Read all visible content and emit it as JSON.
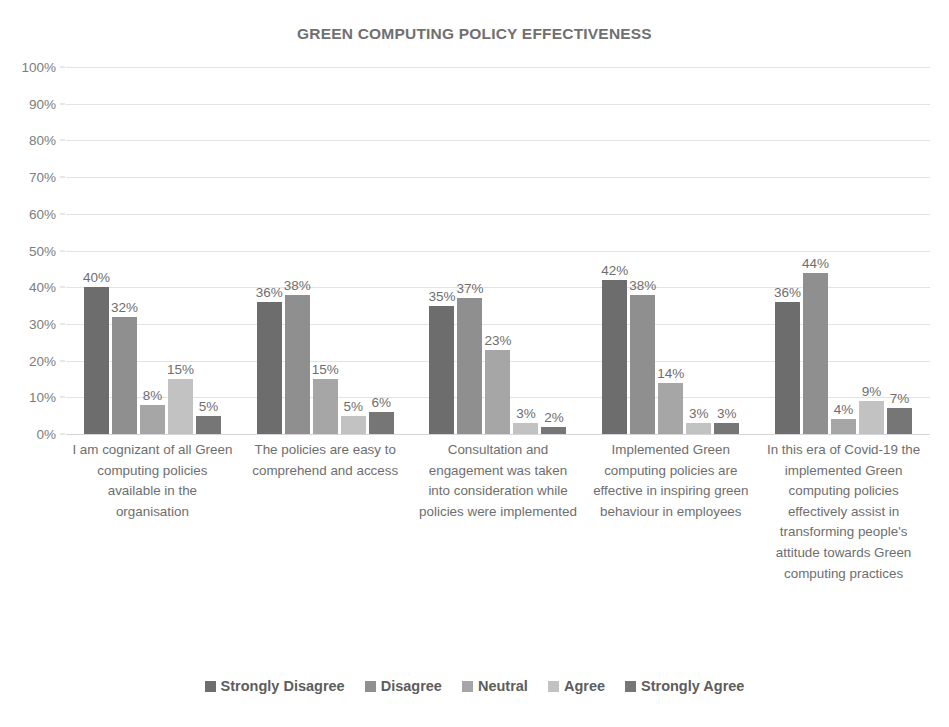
{
  "chart_data": {
    "type": "bar",
    "title": "GREEN COMPUTING POLICY EFFECTIVENESS",
    "xlabel": "",
    "ylabel": "",
    "ylim": [
      0,
      100
    ],
    "yticks": [
      "100%",
      "90%",
      "80%",
      "70%",
      "60%",
      "50%",
      "40%",
      "30%",
      "20%",
      "10%",
      "0%"
    ],
    "ytick_values": [
      100,
      90,
      80,
      70,
      60,
      50,
      40,
      30,
      20,
      10,
      0
    ],
    "grid": true,
    "legend_position": "bottom",
    "value_suffix": "%",
    "categories": [
      "I am cognizant of all Green computing policies available in the organisation",
      "The policies are easy to comprehend and access",
      "Consultation and engagement was taken into consideration while policies were implemented",
      "Implemented Green computing policies are effective in inspiring green behaviour in employees",
      "In this era of Covid-19 the implemented Green computing policies effectively assist in transforming people's attitude towards Green computing practices"
    ],
    "series": [
      {
        "name": "Strongly Disagree",
        "color": "#6d6d6d",
        "values": [
          40,
          36,
          35,
          42,
          36
        ]
      },
      {
        "name": "Disagree",
        "color": "#8f8f8f",
        "values": [
          32,
          38,
          37,
          38,
          44
        ]
      },
      {
        "name": "Neutral",
        "color": "#a6a6a6",
        "values": [
          8,
          15,
          23,
          14,
          4
        ]
      },
      {
        "name": "Agree",
        "color": "#c2c2c2",
        "values": [
          15,
          5,
          3,
          3,
          9
        ]
      },
      {
        "name": "Strongly Agree",
        "color": "#767676",
        "values": [
          5,
          6,
          2,
          3,
          7
        ]
      }
    ],
    "data_labels": [
      [
        "40%",
        "32%",
        "8%",
        "15%",
        "5%"
      ],
      [
        "36%",
        "38%",
        "15%",
        "5%",
        "6%"
      ],
      [
        "35%",
        "37%",
        "23%",
        "3%",
        "2%"
      ],
      [
        "42%",
        "38%",
        "14%",
        "3%",
        "3%"
      ],
      [
        "36%",
        "44%",
        "4%",
        "9%",
        "7%"
      ]
    ]
  }
}
